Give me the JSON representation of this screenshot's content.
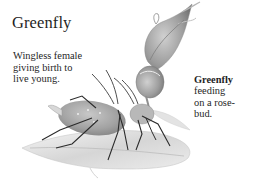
{
  "title": "Greenfly",
  "captions": {
    "left": {
      "lines": [
        "Wingless female",
        "giving birth to",
        "live young."
      ]
    },
    "right": {
      "bold": "Greenfly",
      "lines": [
        "feeding",
        "on a rose-",
        "bud."
      ]
    }
  },
  "illustration": {
    "subject": "greenfly-aphids-on-rose-leaf",
    "elements": [
      "rosebud",
      "rose-leaf",
      "wingless-female-aphid",
      "feeding-aphid"
    ],
    "palette": {
      "leaf": "#dedede",
      "body": "#a9a9a9",
      "legs": "#2b2b2b",
      "bud": "#9a9a9a"
    }
  }
}
